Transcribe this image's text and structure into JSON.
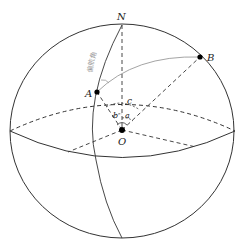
{
  "diagram": {
    "title": "",
    "points": {
      "N": {
        "label": "N",
        "x": 122,
        "y": 25
      },
      "A": {
        "label": "A",
        "x": 97,
        "y": 92
      },
      "B": {
        "label": "B",
        "x": 200,
        "y": 57
      },
      "O": {
        "label": "O",
        "x": 122,
        "y": 130
      }
    },
    "angle_labels": {
      "a": "a",
      "b": "b",
      "c": "c"
    },
    "annotation": {
      "yaw_angle": "偏航角"
    },
    "colors": {
      "outline": "#333333",
      "arc_gray": "#9a9a9a",
      "point": "#000000"
    }
  }
}
